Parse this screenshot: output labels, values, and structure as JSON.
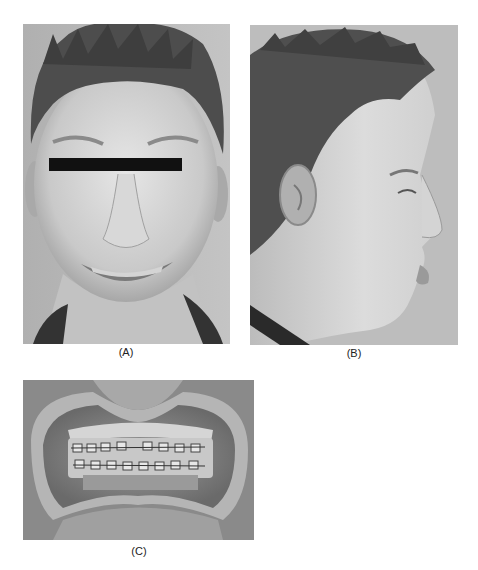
{
  "figure": {
    "panels": [
      {
        "id": "A",
        "label": "(A)",
        "description": "Frontal smiling facial photograph with black bar over eyes"
      },
      {
        "id": "B",
        "label": "(B)",
        "description": "Right profile facial photograph"
      },
      {
        "id": "C",
        "label": "(C)",
        "description": "Intraoral frontal photograph with cheek retractors showing fixed orthodontic brackets"
      }
    ],
    "colors": {
      "background": "#ffffff",
      "photo_background": "#b9b9b9",
      "censor_bar": "#111111"
    }
  }
}
